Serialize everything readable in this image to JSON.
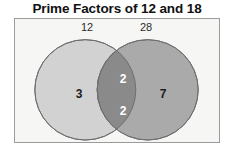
{
  "title": "Prime Factors of 12 and 18",
  "colors": {
    "panel_background": "#f6f6f4",
    "panel_border": "#9b9b9b",
    "left_circle_fill": "#d2d2d2",
    "right_circle_fill": "#aaaaaa",
    "intersection_fill": "#8a8a8a",
    "circle_stroke": "#6e6e6e",
    "title_text": "#111111",
    "region_text_dark": "#1c1c1c",
    "region_text_light": "#ffffff"
  },
  "diagram": {
    "type": "venn",
    "sets": [
      {
        "name": "left-set",
        "label": "12",
        "value": "3"
      },
      {
        "name": "right-set",
        "label": "28",
        "value": "7"
      }
    ],
    "intersection": {
      "values": [
        "2",
        "2"
      ]
    }
  }
}
